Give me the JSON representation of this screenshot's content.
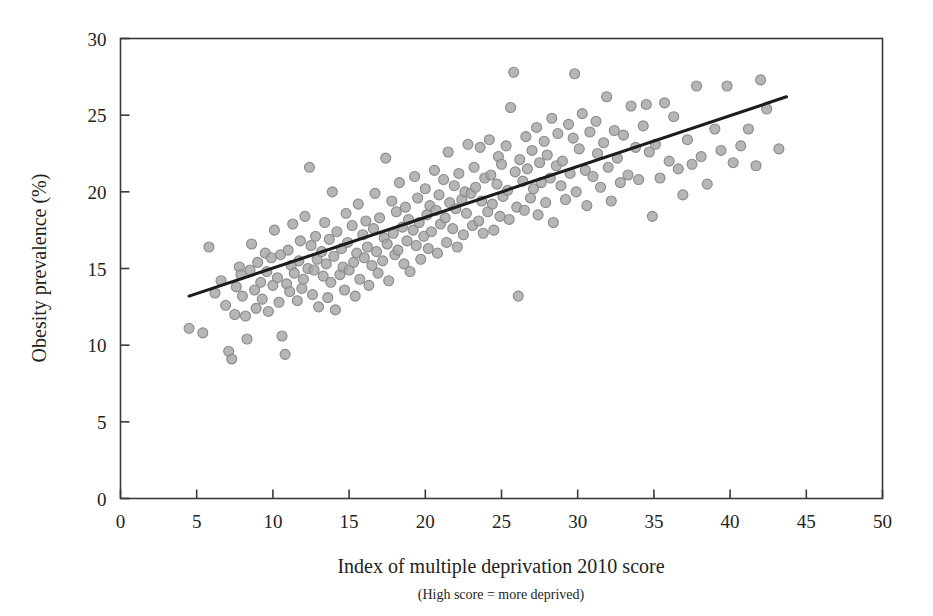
{
  "chart_data": {
    "type": "scatter",
    "title": "",
    "xlabel": "Index of multiple deprivation 2010 score",
    "xlabel_note": "(High score = more deprived)",
    "ylabel": "Obesity prevalence (%)",
    "xlim": [
      0,
      50
    ],
    "ylim": [
      0,
      30
    ],
    "xticks": [
      0,
      5,
      10,
      15,
      20,
      25,
      30,
      35,
      40,
      45,
      50
    ],
    "yticks": [
      0,
      5,
      10,
      15,
      20,
      25,
      30
    ],
    "grid": false,
    "legend": "none",
    "marker": {
      "shape": "circle",
      "fill": "#a6a6a6",
      "edge": "#8a8a8a",
      "size_px": 10,
      "opacity": 0.82
    },
    "trend_line": {
      "label": "linear fit",
      "color": "#1c1c1c",
      "x_start": 4.5,
      "y_start": 13.2,
      "x_end": 43.7,
      "y_end": 26.2,
      "slope": 0.332,
      "intercept": 11.71
    },
    "series": [
      {
        "name": "Local authority areas",
        "points": [
          [
            4.5,
            11.1
          ],
          [
            5.4,
            10.8
          ],
          [
            5.8,
            16.4
          ],
          [
            6.2,
            13.4
          ],
          [
            6.6,
            14.2
          ],
          [
            6.9,
            12.6
          ],
          [
            7.1,
            9.6
          ],
          [
            7.3,
            9.1
          ],
          [
            7.5,
            12.0
          ],
          [
            7.6,
            13.8
          ],
          [
            7.8,
            15.1
          ],
          [
            7.9,
            14.6
          ],
          [
            8.0,
            13.2
          ],
          [
            8.2,
            11.9
          ],
          [
            8.3,
            10.4
          ],
          [
            8.5,
            14.9
          ],
          [
            8.6,
            16.6
          ],
          [
            8.8,
            13.6
          ],
          [
            8.9,
            12.4
          ],
          [
            9.0,
            15.4
          ],
          [
            9.2,
            14.1
          ],
          [
            9.3,
            13.0
          ],
          [
            9.5,
            16.0
          ],
          [
            9.6,
            14.8
          ],
          [
            9.7,
            12.2
          ],
          [
            9.9,
            15.7
          ],
          [
            10.0,
            13.9
          ],
          [
            10.1,
            17.5
          ],
          [
            10.3,
            14.4
          ],
          [
            10.4,
            12.8
          ],
          [
            10.5,
            15.9
          ],
          [
            10.6,
            10.6
          ],
          [
            10.8,
            9.4
          ],
          [
            10.9,
            14.0
          ],
          [
            11.0,
            16.2
          ],
          [
            11.1,
            13.5
          ],
          [
            11.2,
            15.2
          ],
          [
            11.3,
            17.9
          ],
          [
            11.4,
            14.7
          ],
          [
            11.6,
            12.9
          ],
          [
            11.7,
            15.5
          ],
          [
            11.8,
            16.8
          ],
          [
            11.9,
            13.7
          ],
          [
            12.0,
            14.3
          ],
          [
            12.1,
            18.4
          ],
          [
            12.3,
            15.0
          ],
          [
            12.4,
            21.6
          ],
          [
            12.5,
            16.5
          ],
          [
            12.6,
            13.3
          ],
          [
            12.7,
            14.9
          ],
          [
            12.8,
            17.1
          ],
          [
            12.9,
            15.6
          ],
          [
            13.0,
            12.5
          ],
          [
            13.2,
            16.1
          ],
          [
            13.3,
            14.5
          ],
          [
            13.4,
            18.0
          ],
          [
            13.5,
            15.3
          ],
          [
            13.6,
            13.1
          ],
          [
            13.7,
            16.9
          ],
          [
            13.8,
            14.1
          ],
          [
            13.9,
            20.0
          ],
          [
            14.0,
            15.8
          ],
          [
            14.1,
            12.3
          ],
          [
            14.2,
            17.4
          ],
          [
            14.4,
            14.6
          ],
          [
            14.5,
            16.3
          ],
          [
            14.6,
            15.1
          ],
          [
            14.7,
            13.6
          ],
          [
            14.8,
            18.6
          ],
          [
            14.9,
            16.7
          ],
          [
            15.0,
            14.9
          ],
          [
            15.2,
            17.8
          ],
          [
            15.3,
            15.4
          ],
          [
            15.4,
            13.2
          ],
          [
            15.5,
            16.0
          ],
          [
            15.6,
            19.2
          ],
          [
            15.7,
            14.3
          ],
          [
            15.9,
            17.2
          ],
          [
            16.0,
            15.7
          ],
          [
            16.1,
            18.1
          ],
          [
            16.2,
            16.4
          ],
          [
            16.3,
            13.9
          ],
          [
            16.5,
            15.2
          ],
          [
            16.6,
            17.6
          ],
          [
            16.7,
            19.9
          ],
          [
            16.8,
            16.1
          ],
          [
            16.9,
            14.7
          ],
          [
            17.0,
            18.3
          ],
          [
            17.2,
            15.5
          ],
          [
            17.3,
            17.0
          ],
          [
            17.4,
            22.2
          ],
          [
            17.5,
            16.6
          ],
          [
            17.6,
            14.2
          ],
          [
            17.8,
            19.4
          ],
          [
            17.9,
            17.3
          ],
          [
            18.0,
            15.9
          ],
          [
            18.1,
            18.7
          ],
          [
            18.2,
            16.2
          ],
          [
            18.3,
            20.6
          ],
          [
            18.5,
            17.7
          ],
          [
            18.6,
            15.3
          ],
          [
            18.7,
            19.0
          ],
          [
            18.8,
            16.8
          ],
          [
            18.9,
            18.2
          ],
          [
            19.0,
            14.8
          ],
          [
            19.2,
            17.5
          ],
          [
            19.3,
            21.0
          ],
          [
            19.4,
            16.5
          ],
          [
            19.5,
            19.6
          ],
          [
            19.6,
            18.0
          ],
          [
            19.7,
            15.6
          ],
          [
            19.9,
            17.1
          ],
          [
            20.0,
            20.2
          ],
          [
            20.1,
            18.5
          ],
          [
            20.2,
            16.3
          ],
          [
            20.3,
            19.1
          ],
          [
            20.4,
            17.4
          ],
          [
            20.6,
            21.4
          ],
          [
            20.7,
            18.8
          ],
          [
            20.8,
            16.0
          ],
          [
            20.9,
            19.8
          ],
          [
            21.0,
            17.9
          ],
          [
            21.2,
            20.8
          ],
          [
            21.3,
            18.3
          ],
          [
            21.4,
            16.7
          ],
          [
            21.5,
            22.6
          ],
          [
            21.6,
            19.3
          ],
          [
            21.8,
            17.6
          ],
          [
            21.9,
            20.4
          ],
          [
            22.0,
            18.9
          ],
          [
            22.1,
            16.4
          ],
          [
            22.2,
            21.2
          ],
          [
            22.4,
            19.5
          ],
          [
            22.5,
            17.2
          ],
          [
            22.6,
            20.0
          ],
          [
            22.7,
            18.6
          ],
          [
            22.8,
            23.1
          ],
          [
            23.0,
            19.9
          ],
          [
            23.1,
            17.8
          ],
          [
            23.2,
            21.6
          ],
          [
            23.3,
            20.3
          ],
          [
            23.5,
            18.1
          ],
          [
            23.6,
            22.9
          ],
          [
            23.7,
            19.4
          ],
          [
            23.8,
            17.3
          ],
          [
            23.9,
            20.9
          ],
          [
            24.1,
            18.7
          ],
          [
            24.2,
            23.4
          ],
          [
            24.3,
            21.1
          ],
          [
            24.4,
            19.2
          ],
          [
            24.5,
            17.5
          ],
          [
            24.7,
            20.5
          ],
          [
            24.8,
            22.3
          ],
          [
            24.9,
            18.4
          ],
          [
            25.0,
            21.8
          ],
          [
            25.1,
            19.7
          ],
          [
            25.3,
            23.0
          ],
          [
            25.4,
            20.1
          ],
          [
            25.5,
            18.2
          ],
          [
            25.6,
            25.5
          ],
          [
            25.8,
            27.8
          ],
          [
            25.9,
            21.3
          ],
          [
            26.0,
            19.0
          ],
          [
            26.1,
            13.2
          ],
          [
            26.2,
            22.1
          ],
          [
            26.4,
            20.7
          ],
          [
            26.5,
            18.8
          ],
          [
            26.6,
            23.6
          ],
          [
            26.7,
            21.5
          ],
          [
            26.9,
            19.6
          ],
          [
            27.0,
            22.7
          ],
          [
            27.1,
            20.2
          ],
          [
            27.3,
            24.2
          ],
          [
            27.4,
            18.5
          ],
          [
            27.5,
            21.9
          ],
          [
            27.6,
            20.6
          ],
          [
            27.8,
            23.3
          ],
          [
            27.9,
            19.3
          ],
          [
            28.0,
            22.4
          ],
          [
            28.2,
            20.9
          ],
          [
            28.3,
            24.8
          ],
          [
            28.4,
            18.0
          ],
          [
            28.6,
            21.7
          ],
          [
            28.7,
            23.8
          ],
          [
            28.9,
            20.4
          ],
          [
            29.0,
            22.0
          ],
          [
            29.2,
            19.5
          ],
          [
            29.4,
            24.4
          ],
          [
            29.5,
            21.2
          ],
          [
            29.7,
            23.5
          ],
          [
            29.8,
            27.7
          ],
          [
            29.9,
            20.0
          ],
          [
            30.1,
            22.8
          ],
          [
            30.3,
            25.1
          ],
          [
            30.5,
            21.4
          ],
          [
            30.6,
            19.1
          ],
          [
            30.8,
            23.9
          ],
          [
            31.0,
            21.0
          ],
          [
            31.2,
            24.6
          ],
          [
            31.3,
            22.5
          ],
          [
            31.5,
            20.3
          ],
          [
            31.7,
            23.2
          ],
          [
            31.9,
            26.2
          ],
          [
            32.0,
            21.6
          ],
          [
            32.2,
            19.4
          ],
          [
            32.4,
            24.0
          ],
          [
            32.6,
            22.2
          ],
          [
            32.8,
            20.6
          ],
          [
            33.0,
            23.7
          ],
          [
            33.3,
            21.1
          ],
          [
            33.5,
            25.6
          ],
          [
            33.8,
            22.9
          ],
          [
            34.0,
            20.8
          ],
          [
            34.3,
            24.3
          ],
          [
            34.5,
            25.7
          ],
          [
            34.7,
            22.6
          ],
          [
            34.9,
            18.4
          ],
          [
            35.1,
            23.1
          ],
          [
            35.4,
            20.9
          ],
          [
            35.7,
            25.8
          ],
          [
            36.0,
            22.0
          ],
          [
            36.3,
            24.9
          ],
          [
            36.6,
            21.5
          ],
          [
            36.9,
            19.8
          ],
          [
            37.2,
            23.4
          ],
          [
            37.5,
            21.8
          ],
          [
            37.8,
            26.9
          ],
          [
            38.1,
            22.3
          ],
          [
            38.5,
            20.5
          ],
          [
            39.0,
            24.1
          ],
          [
            39.4,
            22.7
          ],
          [
            39.8,
            26.9
          ],
          [
            40.2,
            21.9
          ],
          [
            40.7,
            23.0
          ],
          [
            41.2,
            24.1
          ],
          [
            41.7,
            21.7
          ],
          [
            42.0,
            27.3
          ],
          [
            42.4,
            25.4
          ],
          [
            43.2,
            22.8
          ]
        ]
      }
    ]
  },
  "axes": {
    "x_tick_labels": [
      "0",
      "5",
      "10",
      "15",
      "20",
      "25",
      "30",
      "35",
      "40",
      "45",
      "50"
    ],
    "y_tick_labels": [
      "0",
      "5",
      "10",
      "15",
      "20",
      "25",
      "30"
    ]
  }
}
